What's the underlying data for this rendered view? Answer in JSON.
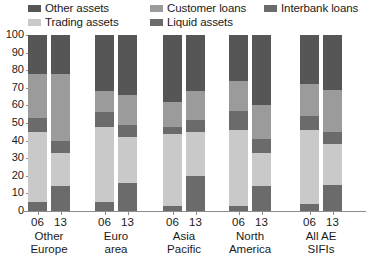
{
  "chart_data": {
    "type": "bar",
    "stacked": true,
    "title": "",
    "subtitle": "",
    "xlabel": "",
    "ylabel": "",
    "ylim": [
      0,
      100
    ],
    "yticks": [
      0,
      10,
      20,
      30,
      40,
      50,
      60,
      70,
      80,
      90,
      100
    ],
    "ytick_labels": [
      "0",
      "10",
      "20",
      "30",
      "40",
      "50",
      "60",
      "70",
      "80",
      "90",
      "100"
    ],
    "grid": false,
    "legend_position": "top",
    "categories": [
      "Other Europe 06",
      "Other Europe 13",
      "Euro area 06",
      "Euro area 13",
      "Asia Pacific 06",
      "Asia Pacific 13",
      "North America 06",
      "North America 13",
      "All AE SIFIs 06",
      "All AE SIFIs 13"
    ],
    "groups": [
      {
        "name": "Other Europe",
        "line1": "Other",
        "line2": "Europe",
        "years": [
          "06",
          "13"
        ]
      },
      {
        "name": "Euro area",
        "line1": "Euro",
        "line2": "area",
        "years": [
          "06",
          "13"
        ]
      },
      {
        "name": "Asia Pacific",
        "line1": "Asia",
        "line2": "Pacific",
        "years": [
          "06",
          "13"
        ]
      },
      {
        "name": "North America",
        "line1": "North",
        "line2": "America",
        "years": [
          "06",
          "13"
        ]
      },
      {
        "name": "All AE SIFIs",
        "line1": "All AE",
        "line2": "SIFIs",
        "years": [
          "06",
          "13"
        ]
      }
    ],
    "series": [
      {
        "name": "Liquid assets",
        "color": "#6b6b6b",
        "order": 1,
        "values": [
          5,
          14,
          5,
          16,
          3,
          20,
          3,
          14,
          4,
          15
        ]
      },
      {
        "name": "Trading assets",
        "color": "#c9c9c9",
        "order": 2,
        "values": [
          40,
          19,
          43,
          26,
          41,
          25,
          43,
          19,
          42,
          23
        ]
      },
      {
        "name": "Interbank loans",
        "color": "#6b6b6b",
        "order": 3,
        "values": [
          8,
          7,
          8,
          7,
          4,
          7,
          11,
          8,
          8,
          7
        ]
      },
      {
        "name": "Customer loans",
        "color": "#9b9b9b",
        "order": 4,
        "values": [
          25,
          38,
          12,
          17,
          14,
          16,
          17,
          19,
          18,
          24
        ]
      },
      {
        "name": "Other assets",
        "color": "#565656",
        "order": 5,
        "values": [
          22,
          22,
          32,
          34,
          38,
          32,
          26,
          40,
          28,
          31
        ]
      }
    ]
  },
  "legend": {
    "items": [
      {
        "label": "Other assets",
        "color": "#565656"
      },
      {
        "label": "Customer loans",
        "color": "#9b9b9b"
      },
      {
        "label": "Interbank loans",
        "color": "#6b6b6b"
      },
      {
        "label": "Trading assets",
        "color": "#c9c9c9"
      },
      {
        "label": "Liquid assets",
        "color": "#6b6b6b"
      }
    ]
  },
  "axis": {
    "y_labels": [
      "100",
      "90",
      "80",
      "70",
      "60",
      "50",
      "40",
      "30",
      "20",
      "10",
      "0"
    ]
  }
}
